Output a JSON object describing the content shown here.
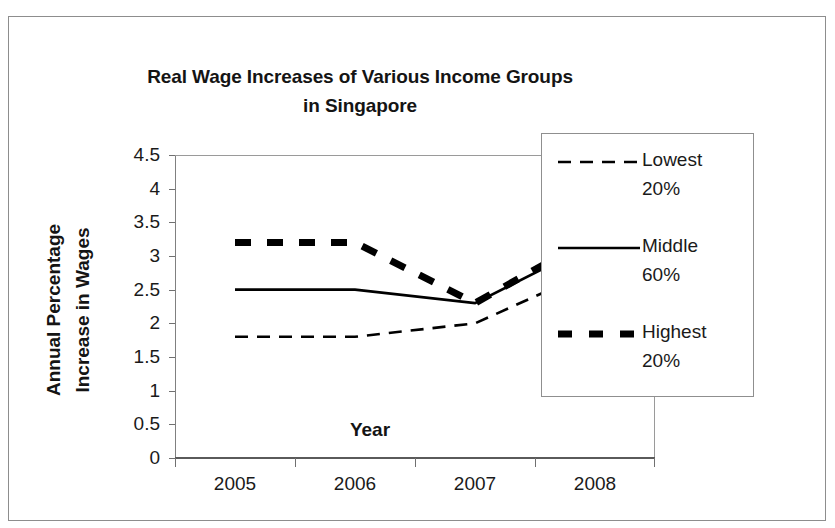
{
  "chart_data": {
    "type": "line",
    "title": "Real Wage Increases of Various Income Groups in Singapore",
    "title_line1": "Real Wage Increases of Various Income Groups",
    "title_line2": "in Singapore",
    "xlabel": "Year",
    "ylabel": "Annual Percentage Increase in Wages",
    "ylabel_line1": "Annual Percentage",
    "ylabel_line2": "Increase in Wages",
    "categories": [
      "2005",
      "2006",
      "2007",
      "2008"
    ],
    "x": [
      2005,
      2006,
      2007,
      2008
    ],
    "ylim": [
      0,
      4.5
    ],
    "yticks": [
      "0",
      "0.5",
      "1",
      "1.5",
      "2",
      "2.5",
      "3",
      "3.5",
      "4",
      "4.5"
    ],
    "ytick_values": [
      0,
      0.5,
      1,
      1.5,
      2,
      2.5,
      3,
      3.5,
      4,
      4.5
    ],
    "grid": false,
    "legend_position": "right",
    "series": [
      {
        "name": "Lowest 20%",
        "name_line1": "Lowest",
        "name_line2": "20%",
        "style": "dashed",
        "color": "#000000",
        "values": [
          1.8,
          1.8,
          2.0,
          2.8
        ]
      },
      {
        "name": "Middle 60%",
        "name_line1": "Middle",
        "name_line2": "60%",
        "style": "solid",
        "color": "#000000",
        "values": [
          2.5,
          2.5,
          2.3,
          3.2
        ]
      },
      {
        "name": "Highest 20%",
        "name_line1": "Highest",
        "name_line2": "20%",
        "style": "thick-dashed",
        "color": "#000000",
        "values": [
          3.2,
          3.2,
          2.3,
          3.3
        ]
      }
    ],
    "annotations": []
  },
  "legend": {
    "items": [
      {
        "label_line1": "Lowest",
        "label_line2": "20%"
      },
      {
        "label_line1": "Middle",
        "label_line2": "60%"
      },
      {
        "label_line1": "Highest",
        "label_line2": "20%"
      }
    ]
  },
  "axes": {
    "x_title": "Year",
    "y_title_line1": "Annual Percentage",
    "y_title_line2": "Increase in Wages"
  }
}
